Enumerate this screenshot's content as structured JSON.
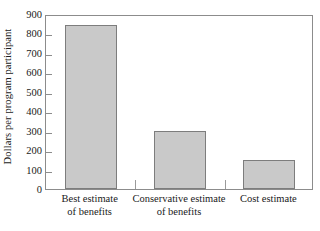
{
  "chart_data": {
    "type": "bar",
    "title": "",
    "xlabel": "",
    "ylabel": "Dollars per program participant",
    "categories": [
      "Best estimate of benefits",
      "Conservative estimate of benefits",
      "Cost estimate"
    ],
    "category_lines": [
      [
        "Best estimate",
        "of benefits"
      ],
      [
        "Conservative estimate",
        "of benefits"
      ],
      [
        "Cost estimate",
        ""
      ]
    ],
    "values": [
      845,
      300,
      150
    ],
    "ylim": [
      0,
      900
    ],
    "yticks": [
      0,
      100,
      200,
      300,
      400,
      500,
      600,
      700,
      800,
      900
    ],
    "ytick_labels": [
      "0",
      "100",
      "200",
      "300",
      "400",
      "500",
      "600",
      "700",
      "800",
      "900"
    ],
    "grid": false,
    "legend": "none",
    "bar_fill_color": "#c9c9c9",
    "bar_edge_color": "#7d7d7d",
    "frame_color": "#8c8c8c",
    "background_color": "#ffffff"
  }
}
